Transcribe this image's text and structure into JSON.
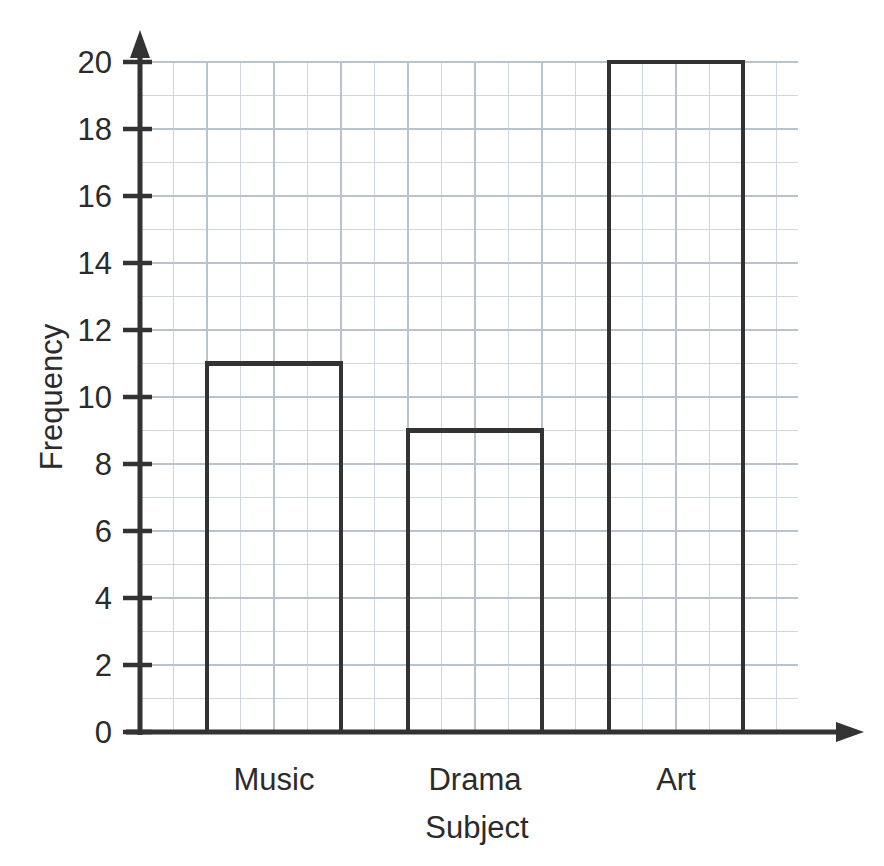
{
  "chart_data": {
    "type": "bar",
    "title": "",
    "subtitle": "",
    "categories": [
      "Music",
      "Drama",
      "Art"
    ],
    "values": [
      11,
      9,
      20
    ],
    "xlabel": "Subject",
    "ylabel": "Frequency",
    "ylim": [
      0,
      20
    ],
    "ytick_labels": [
      "0",
      "2",
      "4",
      "6",
      "8",
      "10",
      "12",
      "14",
      "16",
      "18",
      "20"
    ],
    "ytick_values": [
      0,
      2,
      4,
      6,
      8,
      10,
      12,
      14,
      16,
      18,
      20
    ],
    "y_major_step": 2,
    "y_minor_step": 1,
    "grid": true,
    "grid_style": "graph-paper",
    "legend": null,
    "legend_position": "none",
    "bar_style": "outline",
    "annotations": []
  },
  "axes": {
    "y_axis_name": "frequency-axis",
    "x_axis_name": "subject-axis",
    "y_arrow": true,
    "x_arrow": true
  },
  "colors": {
    "ink": "#333333",
    "bar_outline": "#333333",
    "bar_fill": "none",
    "grid_minor": "#cfd6de",
    "grid_major": "#b9c3ce",
    "text": "#2b2b2b",
    "background": "#ffffff"
  }
}
